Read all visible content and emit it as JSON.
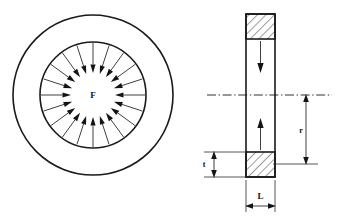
{
  "figure": {
    "background_color": "#ffffff",
    "line_color": "#1a1a1a"
  },
  "plan_view": {
    "name": "plan-view",
    "description": "Concentric circles with radial arrows pointing inward from the inner circle",
    "force_label": "F",
    "outer_circle": {
      "cx": 93,
      "cy": 95,
      "r": 80
    },
    "inner_circle": {
      "cx": 93,
      "cy": 95,
      "r": 53
    },
    "arrow_count": 20,
    "arrow_outer_radius": 52,
    "arrow_inner_radius": 22
  },
  "section_view": {
    "name": "cross-section-view",
    "description": "Vertical rectangular cross-section with hatched top and bottom flanges",
    "body": {
      "x": 246,
      "y": 14,
      "width": 29,
      "height": 163
    },
    "top_hatch": {
      "x": 246,
      "y": 14,
      "width": 29,
      "height": 25
    },
    "bottom_hatch": {
      "x": 246,
      "y": 152,
      "width": 29,
      "height": 25
    },
    "centerline_y": 95,
    "interior_arrows": [
      {
        "direction": "down",
        "from_y": 42,
        "to_y": 72
      },
      {
        "direction": "up",
        "from_y": 148,
        "to_y": 118
      }
    ]
  },
  "dimensions": [
    {
      "name": "thickness-dimension",
      "label": "t",
      "orientation": "vertical",
      "measures": "bottom flange thickness",
      "x": 214,
      "y_top": 152,
      "y_bottom": 177
    },
    {
      "name": "length-dimension",
      "label": "L",
      "orientation": "horizontal",
      "measures": "section width",
      "y": 203,
      "x_left": 246,
      "x_right": 275
    },
    {
      "name": "radius-dimension",
      "label": "r",
      "orientation": "vertical",
      "measures": "radius from centerline to bottom flange",
      "x": 306,
      "y_top": 95,
      "y_bottom": 164
    }
  ],
  "labels": {
    "force": "F",
    "thickness": "t",
    "length": "L",
    "radius": "r"
  }
}
